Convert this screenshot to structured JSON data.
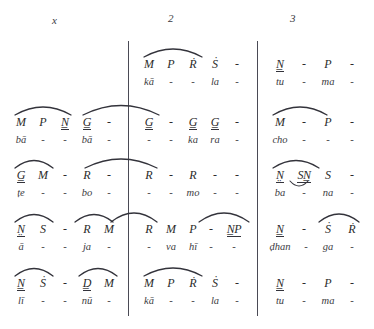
{
  "markers": [
    {
      "label": "x",
      "x": 52,
      "y": 14
    },
    {
      "label": "2",
      "x": 168,
      "y": 12
    },
    {
      "label": "3",
      "x": 290,
      "y": 12
    }
  ],
  "systems": [
    {
      "row": 1,
      "measures": [
        {
          "section": "left",
          "notes": [
            "",
            "",
            "",
            "",
            ""
          ],
          "lyrics": [
            "",
            "",
            "",
            "",
            ""
          ]
        },
        {
          "section": "middle",
          "notes": [
            "M",
            "P",
            "Ṙ",
            "Ṡ",
            "-"
          ],
          "lyrics": [
            "kā",
            "-",
            "-",
            "la",
            "-"
          ]
        },
        {
          "section": "right",
          "notes": [
            "N̲",
            "-",
            "P",
            "-"
          ],
          "lyrics": [
            "tu",
            "-",
            "ma",
            "-"
          ]
        }
      ]
    },
    {
      "row": 2,
      "measures": [
        {
          "section": "left",
          "notes": [
            "M",
            "P",
            "N̲",
            "G̲",
            "-"
          ],
          "lyrics": [
            "bā",
            "-",
            "-",
            "bā",
            "-"
          ]
        },
        {
          "section": "middle",
          "notes": [
            "G̲",
            "-",
            "G̲",
            "G̲",
            "-"
          ],
          "lyrics": [
            "-",
            "-",
            "ka",
            "ra",
            "-"
          ]
        },
        {
          "section": "right",
          "notes": [
            "M",
            "-",
            "P",
            "-"
          ],
          "lyrics": [
            "cho",
            "-",
            "-",
            "-"
          ]
        }
      ]
    },
    {
      "row": 3,
      "measures": [
        {
          "section": "left",
          "notes": [
            "G̲",
            "M",
            "-",
            "R",
            "-"
          ],
          "lyrics": [
            "ṭe",
            "-",
            "-",
            "bo",
            "-"
          ]
        },
        {
          "section": "middle",
          "notes": [
            "R",
            "-",
            "R",
            "-",
            "-"
          ],
          "lyrics": [
            "-",
            "-",
            "mo",
            "-",
            "-"
          ]
        },
        {
          "section": "right",
          "notes": [
            "N̤",
            "SN̲",
            "S",
            "-"
          ],
          "lyrics": [
            "ba",
            "-",
            "na",
            "-"
          ]
        }
      ]
    },
    {
      "row": 4,
      "measures": [
        {
          "section": "left",
          "notes": [
            "N̤",
            "S",
            "-",
            "R",
            "M"
          ],
          "lyrics": [
            "ā",
            "-",
            "-",
            "ja",
            "-"
          ]
        },
        {
          "section": "middle",
          "notes": [
            "R",
            "M",
            "P",
            "-",
            "N̲P"
          ],
          "lyrics": [
            "-",
            "va",
            "hī",
            "-",
            "-"
          ]
        },
        {
          "section": "right",
          "notes": [
            "N̲",
            "-",
            "Ṡ",
            "Ṙ"
          ],
          "lyrics": [
            "ḍhan",
            "-",
            "ga",
            "-"
          ]
        }
      ]
    },
    {
      "row": 5,
      "measures": [
        {
          "section": "left",
          "notes": [
            "N̲",
            "Ṡ",
            "-",
            "D̲",
            "M"
          ],
          "lyrics": [
            "lī",
            "-",
            "-",
            "nū",
            "-"
          ]
        },
        {
          "section": "middle",
          "notes": [
            "M",
            "P",
            "Ṙ",
            "Ṡ",
            "-"
          ],
          "lyrics": [
            "kā",
            "-",
            "-",
            "la",
            "-"
          ]
        },
        {
          "section": "right",
          "notes": [
            "N̲",
            "-",
            "P",
            "-"
          ],
          "lyrics": [
            "tu",
            "-",
            "ma",
            "-"
          ]
        }
      ]
    }
  ],
  "colors": {
    "ink": "#2b2b2b",
    "rule": "#4a4a55",
    "paper": "#ffffff"
  }
}
